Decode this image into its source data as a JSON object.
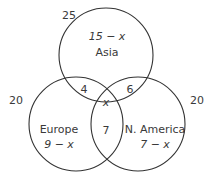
{
  "diagram": {
    "type": "venn",
    "sets": [
      {
        "name": "Asia",
        "total": "25",
        "only": "15 − x"
      },
      {
        "name": "Europe",
        "total": "20",
        "only": "9 − x"
      },
      {
        "name": "N. America",
        "total": "20",
        "only": "7 − x"
      }
    ],
    "intersections": {
      "asia_europe": "4",
      "asia_namerica": "6",
      "europe_namerica": "7",
      "all_three": "x"
    }
  },
  "colors": {
    "stroke": "#333333",
    "text": "#3a3a3a"
  }
}
